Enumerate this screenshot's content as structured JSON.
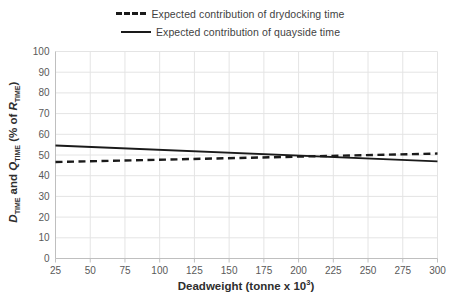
{
  "chart_data": {
    "type": "line",
    "title": "",
    "xlabel": "Deadweight (tonne x 10³)",
    "ylabel": "D_TIME and Q_TIME (% of R_TIME)",
    "xlim": [
      25,
      300
    ],
    "ylim": [
      0,
      100
    ],
    "xticks": [
      25,
      50,
      75,
      100,
      125,
      150,
      175,
      200,
      225,
      250,
      275,
      300
    ],
    "yticks": [
      0,
      10,
      20,
      30,
      40,
      50,
      60,
      70,
      80,
      90,
      100
    ],
    "grid": true,
    "legend_position": "top-center",
    "x": [
      25,
      300
    ],
    "series": [
      {
        "name": "Expected contribution of drydocking time",
        "style": "dashed",
        "color": "#1a1a1a",
        "values": [
          46.6,
          50.7
        ]
      },
      {
        "name": "Expected contribution of quayside time",
        "style": "solid",
        "color": "#1a1a1a",
        "values": [
          54.6,
          46.9
        ]
      }
    ]
  },
  "legend": {
    "items": [
      {
        "label": "Expected contribution of drydocking time",
        "style": "dashed"
      },
      {
        "label": "Expected contribution of quayside time",
        "style": "solid"
      }
    ]
  },
  "axes": {
    "x_title": "Deadweight (tonne x 10",
    "x_title_exp": "3",
    "x_title_tail": ")",
    "y_title_d": "D",
    "y_title_sub1": "TIME",
    "y_title_and": " and ",
    "y_title_q": "Q",
    "y_title_sub2": "TIME",
    "y_title_unit": " (% of ",
    "y_title_r": "R",
    "y_title_sub3": "TIME",
    "y_title_close": ")",
    "x_tick_labels": [
      "25",
      "50",
      "75",
      "100",
      "125",
      "150",
      "175",
      "200",
      "225",
      "250",
      "275",
      "300"
    ],
    "y_tick_labels": [
      "0",
      "10",
      "20",
      "30",
      "40",
      "50",
      "60",
      "70",
      "80",
      "90",
      "100"
    ]
  },
  "colors": {
    "line": "#1a1a1a",
    "grid": "#e4e4e4",
    "axis": "#bfbfbf",
    "text": "#595959",
    "title_text": "#2e2e2e",
    "background": "#ffffff"
  }
}
